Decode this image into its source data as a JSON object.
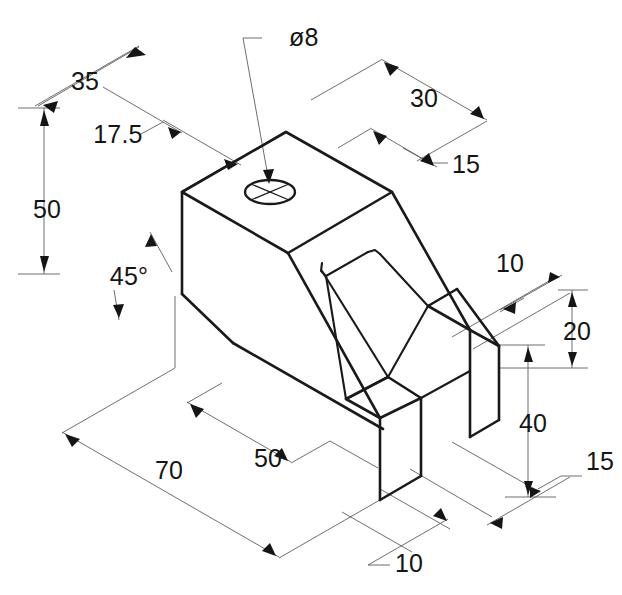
{
  "drawing": {
    "type": "isometric-technical-drawing",
    "background_color": "#ffffff",
    "object_line_color": "#1a1a1a",
    "dimension_line_color": "#5d5d5d",
    "text_color": "#151515",
    "units": "mm"
  },
  "dimensions": {
    "width_35": "35",
    "width_17_5": "17.5",
    "height_50": "50",
    "angle_45": "45°",
    "depth_30": "30",
    "depth_15_top": "15",
    "hole_diameter": "ø8",
    "prong_10_right": "10",
    "height_20": "20",
    "height_40": "40",
    "offset_15_right": "15",
    "length_70": "70",
    "length_50": "50",
    "prong_10_bottom": "10"
  }
}
